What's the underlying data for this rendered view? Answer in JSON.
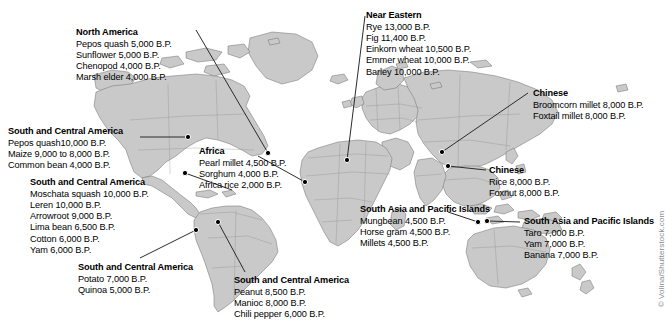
{
  "figure": {
    "credit": "© Volina/Shutterstock.com"
  },
  "colors": {
    "land": "#c9c9c9",
    "land_border": "#6e6e6e",
    "ocean": "#ffffff",
    "text": "#000000",
    "marker": "#000000",
    "leader_line": "#2b2b2b"
  },
  "callouts": [
    {
      "id": "north-america",
      "title": "North America",
      "items": [
        "Pepos quash 5,000 B.P.",
        "Sunflower 5,000 B.P.",
        "Chenopod 4,000 B.P.",
        "Marsh elder 4,000 B.P."
      ]
    },
    {
      "id": "near-eastern",
      "title": "Near Eastern",
      "items": [
        "Rye 13,000 B.P.",
        "Fig 11,400 B.P.",
        "Einkorn wheat 10,500 B.P.",
        "Emmer wheat 10,000 B.P.",
        "Barley 10,000 B.P."
      ]
    },
    {
      "id": "chinese-north",
      "title": "Chinese",
      "items": [
        "Broomcorn millet 8,000 B.P.",
        "Foxtail millet 8,000 B.P."
      ]
    },
    {
      "id": "chinese-south",
      "title": "Chinese",
      "items": [
        "Rice 8,000 B.P.",
        "Foxnut 8,000 B.P."
      ]
    },
    {
      "id": "south-central-america-1",
      "title": "South and Central America",
      "items": [
        "Pepos quash10,000 B.P.",
        "Maize 9,000 to 8,000 B.P.",
        "Common bean 4,000 B.P."
      ]
    },
    {
      "id": "south-central-america-2",
      "title": "South and Central America",
      "items": [
        "Moschata squash 10,000 B.P.",
        "Leren 10,000 B.P.",
        "Arrowroot 9,000 B.P.",
        "Lima bean 6,500 B.P.",
        "Cotton 6,000 B.P.",
        "Yam 6,000 B.P."
      ]
    },
    {
      "id": "south-central-america-3",
      "title": "South and Central America",
      "items": [
        "Potato 7,000 B.P.",
        "Quinoa 5,000 B.P."
      ]
    },
    {
      "id": "south-central-america-4",
      "title": "South and Central America",
      "items": [
        "Peanut 8,500 B.P.",
        "Manioc 8,000 B.P.",
        "Chili pepper 6,000 B.P."
      ]
    },
    {
      "id": "africa",
      "title": "Africa",
      "items": [
        "Pearl millet 4,500 B.P.",
        "Sorghum 4,000 B.P.",
        "Africa rice 2,000 B.P."
      ]
    },
    {
      "id": "south-asia-pacific-1",
      "title": "South Asia and Pacific Islands",
      "items": [
        "Mungbean 4,500 B.P.",
        "Horse gram 4,500 B.P.",
        "Millets 4,500 B.P."
      ]
    },
    {
      "id": "south-asia-pacific-2",
      "title": "South Asia and Pacific Islands",
      "items": [
        "Taro 7,000 B.P.",
        "Yam 7,000 B.P.",
        "Banana 7,000 B.P."
      ]
    }
  ]
}
